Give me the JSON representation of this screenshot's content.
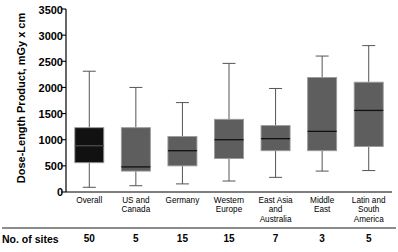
{
  "chart_data": {
    "type": "box",
    "title": "",
    "xlabel": "",
    "ylabel": "Dose-Length Product, mGy x cm",
    "ylim": [
      0,
      3500
    ],
    "ytick_interval": 500,
    "yticks": [
      0,
      500,
      1000,
      1500,
      2000,
      2500,
      3000,
      3500
    ],
    "ytick_labels": [
      "0",
      "500",
      "1000",
      "1500",
      "2000",
      "2500",
      "3000",
      "3500"
    ],
    "grid": false,
    "legend": "none",
    "categories": [
      "Overall",
      "US and\nCanada",
      "Germany",
      "Western\nEurope",
      "East Asia\nand\nAustralia",
      "Middle\nEast",
      "Latin and\nSouth\nAmerica"
    ],
    "boxes": [
      {
        "name": "Overall",
        "whisker_low": 90,
        "q1": 560,
        "median": 885,
        "q3": 1230,
        "whisker_high": 2310,
        "fill": "#111111"
      },
      {
        "name": "US and Canada",
        "whisker_low": 120,
        "q1": 400,
        "median": 480,
        "q3": 1230,
        "whisker_high": 2000,
        "fill": "#5e5e5e"
      },
      {
        "name": "Germany",
        "whisker_low": 155,
        "q1": 500,
        "median": 790,
        "q3": 1060,
        "whisker_high": 1710,
        "fill": "#5e5e5e"
      },
      {
        "name": "Western Europe",
        "whisker_low": 210,
        "q1": 640,
        "median": 1000,
        "q3": 1390,
        "whisker_high": 2460,
        "fill": "#5e5e5e"
      },
      {
        "name": "East Asia and Australia",
        "whisker_low": 280,
        "q1": 790,
        "median": 1020,
        "q3": 1270,
        "whisker_high": 1980,
        "fill": "#5e5e5e"
      },
      {
        "name": "Middle East",
        "whisker_low": 400,
        "q1": 790,
        "median": 1160,
        "q3": 2190,
        "whisker_high": 2600,
        "fill": "#5e5e5e"
      },
      {
        "name": "Latin and South America",
        "whisker_low": 410,
        "q1": 870,
        "median": 1560,
        "q3": 2100,
        "whisker_high": 2800,
        "fill": "#5e5e5e"
      }
    ],
    "annotations": {
      "sites_row_title": "No. of sites",
      "sites_counts": [
        "50",
        "5",
        "15",
        "15",
        "7",
        "3",
        "5"
      ]
    }
  }
}
